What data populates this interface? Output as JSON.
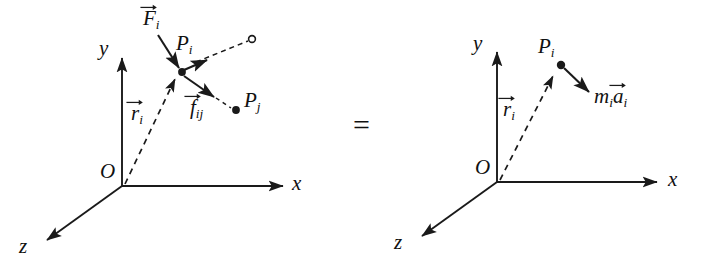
{
  "figure": {
    "kind": "physics-free-body-diagram",
    "caption_text": "",
    "relation_symbol": "=",
    "stroke_color": "#1a1a1a",
    "background_color": "#ffffff",
    "panels": [
      {
        "id": "left",
        "name": "forces-on-particle-i",
        "axes": {
          "x_label": "x",
          "y_label": "y",
          "z_label": "z",
          "origin_label": "O"
        },
        "labels": {
          "position_vector": {
            "base": "r",
            "sub": "i",
            "accent": "vector-arrow"
          },
          "applied_force": {
            "base": "F",
            "sub": "i",
            "accent": "vector-arrow"
          },
          "internal_force": {
            "base": "f",
            "sub": "ij",
            "accent": "vector-arrow"
          },
          "point_i": {
            "base": "P",
            "sub": "i"
          },
          "point_j": {
            "base": "P",
            "sub": "j"
          }
        }
      },
      {
        "id": "right",
        "name": "inertia-term-for-particle-i",
        "axes": {
          "x_label": "x",
          "y_label": "y",
          "z_label": "z",
          "origin_label": "O"
        },
        "labels": {
          "position_vector": {
            "base": "r",
            "sub": "i",
            "accent": "vector-arrow"
          },
          "inertia_vector": {
            "mass": "m",
            "mass_sub": "i",
            "accel": "a",
            "accel_sub": "i",
            "accent": "vector-arrow"
          },
          "point_i": {
            "base": "P",
            "sub": "i"
          }
        }
      }
    ]
  }
}
